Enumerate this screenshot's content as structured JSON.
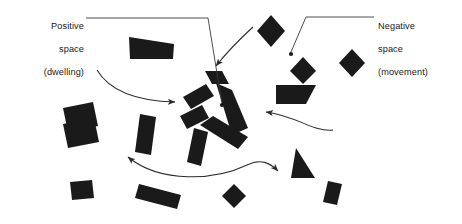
{
  "figure": {
    "background_color": "#ffffff",
    "shape_color": "#1a1a1a",
    "line_color": "#3a3a3a",
    "width": 462,
    "height": 224
  },
  "annotations": {
    "positive": {
      "name": "positive-space-label",
      "text": "Positive\nspace\n(dwelling)",
      "line1": "Positive",
      "line2": "space",
      "line3": "(dwelling)",
      "align": "right",
      "leader": {
        "type": "polyline-with-dot",
        "points": "84,18 208,18 222,105",
        "dot_x": 222,
        "dot_y": 105,
        "dot_r": 2.1
      }
    },
    "negative": {
      "name": "negative-space-label",
      "text": "Negative\nspace\n(movement)",
      "line1": "Negative",
      "line2": "space",
      "line3": "(movement)",
      "align": "left",
      "leader": {
        "type": "polyline-with-dot",
        "points": "374,17 306,17 291,54",
        "dot_x": 291,
        "dot_y": 54,
        "dot_r": 2.1
      }
    }
  },
  "arrows": [
    {
      "name": "arrow-from-top-right",
      "path": "M 252,27 C 241,36 231,46 220,62",
      "head_at": [
        211,
        73
      ],
      "head_angle": 126,
      "double": false
    },
    {
      "name": "arrow-from-left",
      "path": "M 97,71 C 108,90 132,102 168,102",
      "head_at": [
        184,
        103
      ],
      "head_angle": 8,
      "double": false
    },
    {
      "name": "arrow-from-right",
      "path": "M 331,129 C 311,131 299,117 278,113",
      "head_at": [
        258,
        112
      ],
      "head_angle": 188,
      "double": false
    },
    {
      "name": "arrow-bottom-double",
      "path": "M 127,156 C 160,183 215,180 246,165 C 260,158 268,162 276,170",
      "head_at": [
        283,
        177
      ],
      "head_angle": 44,
      "tail_head_at": [
        122,
        152
      ],
      "tail_head_angle": 218,
      "double": true
    }
  ],
  "shapes": [
    {
      "name": "shape-wedge-top-left",
      "kind": "wedge",
      "cx": 152,
      "cy": 48,
      "w": 46,
      "h": 23,
      "rot": -3
    },
    {
      "name": "shape-diamond-top-right",
      "kind": "diamond",
      "cx": 271,
      "cy": 31,
      "w": 27,
      "h": 31,
      "rot": 0
    },
    {
      "name": "shape-diamond-upper-right",
      "cx": 342,
      "cy": 64,
      "kind": "diamond",
      "w": 24,
      "h": 28,
      "rot": 0
    },
    {
      "name": "shape-parallelogram-right",
      "kind": "parallelogram",
      "cx": 294,
      "cy": 94,
      "w": 40,
      "h": 20,
      "rot": 0
    },
    {
      "name": "shape-rect-left",
      "kind": "rect",
      "cx": 78,
      "cy": 117,
      "w": 31,
      "h": 25,
      "rot": -12
    },
    {
      "name": "shape-bar-left-lower",
      "kind": "rect",
      "cx": 148,
      "cy": 134,
      "w": 16,
      "h": 38,
      "rot": 14
    },
    {
      "name": "shape-rect-bottom-left",
      "kind": "rect",
      "cx": 78,
      "cy": 180,
      "w": 31,
      "h": 26,
      "rot": -6
    },
    {
      "name": "shape-rect-small-left",
      "kind": "rect",
      "cx": 80,
      "cy": 190,
      "w": 22,
      "h": 18,
      "rot": -4
    },
    {
      "name": "shape-bar-bottom-center",
      "kind": "rect",
      "cx": 160,
      "cy": 190,
      "w": 44,
      "h": 16,
      "rot": 16
    },
    {
      "name": "shape-bar-bottom-mid",
      "kind": "rect",
      "cx": 201,
      "cy": 146,
      "w": 14,
      "h": 36,
      "rot": 16
    },
    {
      "name": "shape-diamond-bottom-center",
      "kind": "diamond",
      "cx": 234,
      "cy": 196,
      "w": 24,
      "h": 24,
      "rot": 0
    },
    {
      "name": "shape-triangle-bottom-right",
      "kind": "triangle",
      "cx": 304,
      "cy": 163,
      "w": 28,
      "h": 30,
      "rot": 8
    },
    {
      "name": "shape-rect-bottom-right",
      "kind": "rect",
      "cx": 334,
      "cy": 192,
      "w": 16,
      "h": 24,
      "rot": 12
    },
    {
      "name": "shape-diamond-far-right",
      "kind": "diamond",
      "cx": 352,
      "cy": 62,
      "w": 24,
      "h": 27,
      "rot": 0
    }
  ],
  "cluster": {
    "name": "central-pinwheel-cluster",
    "description": "Four bars arranged in a pinwheel around an open courtyard",
    "bars": [
      {
        "name": "cluster-bar-top-left",
        "cx": 196,
        "cy": 96,
        "w": 30,
        "h": 16,
        "rot": -40
      },
      {
        "name": "cluster-bar-top-right",
        "cx": 226,
        "cy": 100,
        "w": 46,
        "h": 17,
        "rot": 52
      },
      {
        "name": "cluster-bar-left",
        "cx": 191,
        "cy": 120,
        "w": 30,
        "h": 17,
        "rot": -38
      },
      {
        "name": "cluster-bar-bottom",
        "cx": 220,
        "cy": 133,
        "w": 46,
        "h": 17,
        "rot": -40
      },
      {
        "name": "cluster-bar-bottom-right",
        "cx": 240,
        "cy": 122,
        "w": 30,
        "h": 17,
        "rot": 50
      },
      {
        "name": "cluster-bar-upper-far",
        "cx": 213,
        "cy": 79,
        "w": 22,
        "h": 14,
        "rot": 44
      }
    ]
  }
}
